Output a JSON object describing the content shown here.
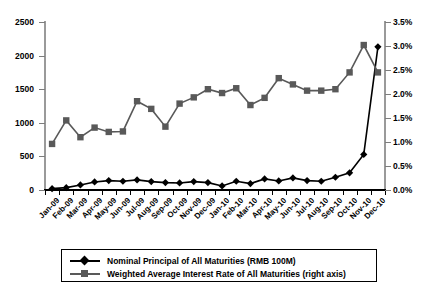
{
  "chart_data": {
    "type": "line",
    "title": "",
    "subtitle": "",
    "xlabel": "",
    "ylabel": "",
    "y2label": "",
    "grid": false,
    "legend_position": "bottom",
    "categories": [
      "Jan-09",
      "Feb-09",
      "Mar-09",
      "Apr-09",
      "May-09",
      "Jun-09",
      "Jul-09",
      "Aug-09",
      "Sep-09",
      "Oct-09",
      "Nov-09",
      "Dec-09",
      "Jan-10",
      "Feb-10",
      "Mar-10",
      "Apr-10",
      "May-10",
      "Jun-10",
      "Jul-10",
      "Aug-10",
      "Sep-10",
      "Oct-10",
      "Nov-10",
      "Dec-10"
    ],
    "ylim": [
      0,
      2500
    ],
    "yticks": [
      0,
      500,
      1000,
      1500,
      2000,
      2500
    ],
    "ytick_labels": [
      "0",
      "500",
      "1000",
      "1500",
      "2000",
      "2500"
    ],
    "y2lim": [
      0,
      3.5
    ],
    "y2ticks": [
      0.0,
      0.5,
      1.0,
      1.5,
      2.0,
      2.5,
      3.0,
      3.5
    ],
    "y2tick_labels": [
      "0.0%",
      "0.5%",
      "1.0%",
      "1.5%",
      "2.0%",
      "2.5%",
      "3.0%",
      "3.5%"
    ],
    "series": [
      {
        "name": "Nominal Principal of All Maturities (RMB 100M)",
        "axis": "left",
        "marker": "diamond",
        "color": "#000000",
        "values": [
          20,
          35,
          75,
          120,
          140,
          130,
          150,
          125,
          110,
          105,
          125,
          110,
          60,
          130,
          95,
          165,
          135,
          180,
          140,
          130,
          190,
          255,
          530,
          2130
        ]
      },
      {
        "name": "Weighted Average Interest Rate of All Maturities (right axis)",
        "axis": "right",
        "marker": "square",
        "color": "#595959",
        "values": [
          0.96,
          1.45,
          1.1,
          1.3,
          1.21,
          1.22,
          1.85,
          1.69,
          1.32,
          1.8,
          1.93,
          2.1,
          2.02,
          2.12,
          1.77,
          1.92,
          2.33,
          2.2,
          2.07,
          2.07,
          2.1,
          2.45,
          3.02,
          2.45
        ]
      }
    ]
  },
  "legend": {
    "entries": [
      {
        "label": "Nominal Principal of All Maturities (RMB 100M)",
        "marker": "diamond-line-marker"
      },
      {
        "label": "Weighted Average Interest Rate of All Maturities (right axis)",
        "marker": "square-line-marker"
      }
    ]
  },
  "colors": {
    "series_primary": "#000000",
    "series_secondary": "#595959",
    "axis": "#9a9a9a",
    "axis_bottom": "#000000",
    "background": "#ffffff"
  }
}
